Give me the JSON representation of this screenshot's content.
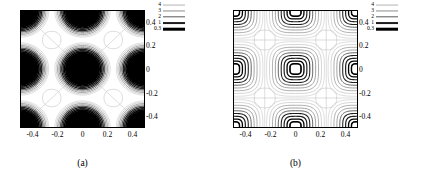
{
  "figure": {
    "width": 425,
    "height": 183,
    "background": "#ffffff"
  },
  "panels": [
    {
      "id": "a",
      "caption": "(a)",
      "caption_name": "panel-a-caption"
    },
    {
      "id": "b",
      "caption": "(b)",
      "caption_name": "panel-b-caption"
    }
  ],
  "legend": {
    "position": "top-right",
    "entries": [
      {
        "label": "4",
        "color": "#b4b4b4",
        "thickness": 0.9
      },
      {
        "label": "3",
        "color": "#8c8c8c",
        "thickness": 1.1
      },
      {
        "label": "2",
        "color": "#5a5a5a",
        "thickness": 1.4
      },
      {
        "label": "1",
        "color": "#1e1e1e",
        "thickness": 1.9
      },
      {
        "label": "0.3",
        "color": "#000000",
        "thickness": 2.6
      }
    ]
  },
  "chart_data": [
    {
      "type": "contour",
      "title": "(a)",
      "xlabel": "",
      "ylabel": "",
      "xlim": [
        -0.5,
        0.5
      ],
      "ylim": [
        -0.5,
        0.5
      ],
      "xticks": [
        -0.4,
        -0.2,
        0,
        0.2,
        0.4
      ],
      "yticks": [
        -0.4,
        -0.2,
        0,
        0.2,
        0.4
      ],
      "xticklabels": [
        "-0.4",
        "-0.2",
        "0",
        "0.2",
        "0.4"
      ],
      "yticklabels": [
        "-0.4",
        "-0.2",
        "0",
        "0.2",
        "0.4"
      ],
      "yaxis_side": "right",
      "grid": false,
      "levels": [
        0.3,
        1,
        2,
        3,
        4
      ],
      "level_colors": [
        "#000000",
        "#1e1e1e",
        "#5a5a5a",
        "#8c8c8c",
        "#b4b4b4"
      ],
      "shape": "circular",
      "filled_core": true,
      "core_radius": 0.135,
      "lattice_centers": [
        [
          0,
          0
        ],
        [
          -0.5,
          -0.5
        ],
        [
          0,
          -0.5
        ],
        [
          0.5,
          -0.5
        ],
        [
          -0.5,
          0
        ],
        [
          0.5,
          0
        ],
        [
          -0.5,
          0.5
        ],
        [
          0,
          0.5
        ],
        [
          0.5,
          0.5
        ]
      ],
      "saddle_points": [
        [
          -0.25,
          -0.25
        ],
        [
          0.25,
          -0.25
        ],
        [
          -0.25,
          0.25
        ],
        [
          0.25,
          0.25
        ]
      ],
      "description": "Concentric circular contours with saturated black core at the origin and at lattice period 0.5; faint rounded-diamond separatrix contours between maxima."
    },
    {
      "type": "contour",
      "title": "(b)",
      "xlabel": "",
      "ylabel": "",
      "xlim": [
        -0.5,
        0.5
      ],
      "ylim": [
        -0.5,
        0.5
      ],
      "xticks": [
        -0.4,
        -0.2,
        0,
        0.2,
        0.4
      ],
      "yticks": [
        -0.4,
        -0.2,
        0,
        0.2,
        0.4
      ],
      "xticklabels": [
        "-0.4",
        "-0.2",
        "0",
        "0.2",
        "0.4"
      ],
      "yticklabels": [
        "-0.4",
        "-0.2",
        "0",
        "0.2",
        "0.4"
      ],
      "yaxis_side": "right",
      "grid": false,
      "levels": [
        0.3,
        1,
        2,
        3,
        4
      ],
      "level_colors": [
        "#000000",
        "#1e1e1e",
        "#5a5a5a",
        "#8c8c8c",
        "#b4b4b4"
      ],
      "shape": "superelliptic",
      "filled_core": false,
      "core_radius": 0.045,
      "lattice_centers": [
        [
          0,
          0
        ],
        [
          -0.5,
          -0.5
        ],
        [
          0,
          -0.5
        ],
        [
          0.5,
          -0.5
        ],
        [
          -0.5,
          0
        ],
        [
          0.5,
          0
        ],
        [
          -0.5,
          0.5
        ],
        [
          0,
          0.5
        ],
        [
          0.5,
          0.5
        ]
      ],
      "saddle_points": [
        [
          -0.25,
          -0.25
        ],
        [
          0.25,
          -0.25
        ],
        [
          -0.25,
          0.25
        ],
        [
          0.25,
          0.25
        ]
      ],
      "description": "Rounded-square (superelliptical) nested contours on a period-0.5 square lattice with open centres and cross-shaped separatrices at the saddle points."
    }
  ]
}
